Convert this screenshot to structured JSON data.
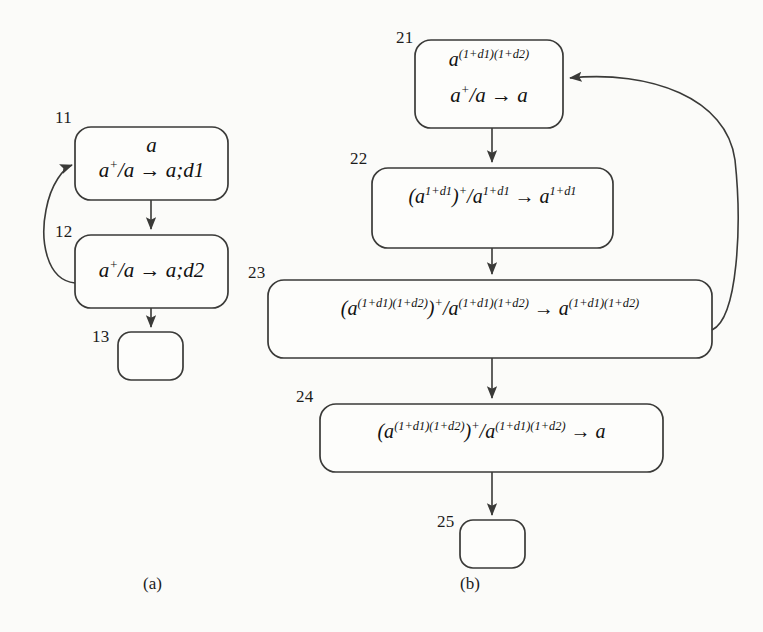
{
  "figure": {
    "background_color": "#fbfbf9",
    "stroke_color": "#3a3a38",
    "captions": [
      {
        "id": "a",
        "text": "(a)"
      },
      {
        "id": "b",
        "text": "(b)"
      }
    ]
  },
  "diagram_a": {
    "caption": "(a)",
    "nodes": [
      {
        "id": "11",
        "label": "11",
        "lines": [
          "a",
          "a⁺/a → a;d1"
        ],
        "empty": false
      },
      {
        "id": "12",
        "label": "12",
        "lines": [
          "a⁺/a → a;d2"
        ],
        "empty": false
      },
      {
        "id": "13",
        "label": "13",
        "lines": [],
        "empty": true
      }
    ],
    "edges": [
      {
        "from": "11",
        "to": "12",
        "kind": "straight-down"
      },
      {
        "from": "12",
        "to": "11",
        "kind": "feedback-left-curve"
      },
      {
        "from": "12",
        "to": "13",
        "kind": "straight-down"
      }
    ]
  },
  "diagram_b": {
    "caption": "(b)",
    "nodes": [
      {
        "id": "21",
        "label": "21",
        "lines": [
          "a^(1+d1)(1+d2)",
          "a⁺/a → a"
        ],
        "empty": false
      },
      {
        "id": "22",
        "label": "22",
        "lines": [
          "(a^1+d1)⁺/a^1+d1 → a^1+d1"
        ],
        "empty": false
      },
      {
        "id": "23",
        "label": "23",
        "lines": [
          "(a^(1+d1)(1+d2))⁺/a^(1+d1)(1+d2) → a^(1+d1)(1+d2)"
        ],
        "empty": false
      },
      {
        "id": "24",
        "label": "24",
        "lines": [
          "(a^(1+d1)(1+d2))⁺/a^(1+d1)(1+d2) → a"
        ],
        "empty": false
      },
      {
        "id": "25",
        "label": "25",
        "lines": [],
        "empty": true
      }
    ],
    "edges": [
      {
        "from": "21",
        "to": "22",
        "kind": "straight-down"
      },
      {
        "from": "22",
        "to": "23",
        "kind": "straight-down"
      },
      {
        "from": "23",
        "to": "24",
        "kind": "straight-down"
      },
      {
        "from": "24",
        "to": "25",
        "kind": "straight-down"
      },
      {
        "from": "23",
        "to": "21",
        "kind": "feedback-right-curve"
      }
    ]
  },
  "labels": {
    "n11": "11",
    "n12": "12",
    "n13": "13",
    "n21": "21",
    "n22": "22",
    "n23": "23",
    "n24": "24",
    "n25": "25"
  }
}
